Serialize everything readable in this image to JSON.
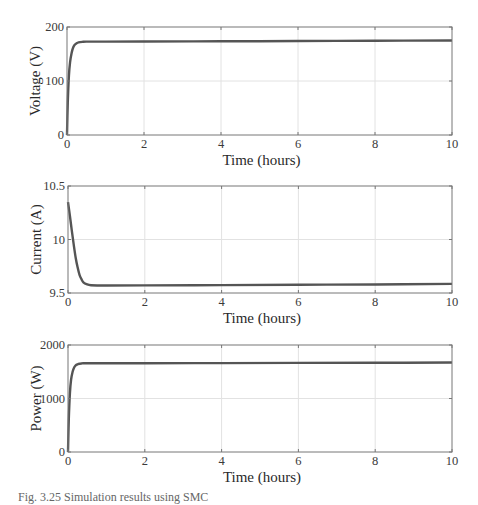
{
  "chart_data": [
    {
      "type": "line",
      "title": "",
      "xlabel": "Time (hours)",
      "ylabel": "Voltage (V)",
      "xlim": [
        0,
        10
      ],
      "ylim": [
        0,
        200
      ],
      "xticks": [
        "0",
        "2",
        "4",
        "6",
        "8",
        "10"
      ],
      "yticks": [
        "0",
        "100",
        "200"
      ],
      "grid": true,
      "series": [
        {
          "name": "Voltage",
          "color": "#555555",
          "x": [
            0,
            0.02,
            0.05,
            0.08,
            0.12,
            0.16,
            0.2,
            0.25,
            0.3,
            0.4,
            0.5,
            1,
            2,
            4,
            6,
            8,
            10
          ],
          "y": [
            0,
            60,
            110,
            135,
            152,
            162,
            167,
            170,
            171.5,
            172.5,
            173,
            173,
            173.2,
            173.5,
            174,
            174.5,
            175
          ]
        }
      ]
    },
    {
      "type": "line",
      "title": "",
      "xlabel": "Time (hours)",
      "ylabel": "Current (A)",
      "xlim": [
        0,
        10
      ],
      "ylim": [
        9.5,
        10.5
      ],
      "xticks": [
        "0",
        "2",
        "4",
        "6",
        "8",
        "10"
      ],
      "yticks": [
        "9.5",
        "10",
        "10.5"
      ],
      "grid": true,
      "series": [
        {
          "name": "Current",
          "color": "#555555",
          "x": [
            0,
            0.05,
            0.1,
            0.15,
            0.2,
            0.25,
            0.3,
            0.35,
            0.4,
            0.5,
            0.6,
            0.8,
            1,
            2,
            4,
            6,
            8,
            10
          ],
          "y": [
            10.35,
            10.22,
            10.08,
            9.95,
            9.83,
            9.74,
            9.67,
            9.63,
            9.6,
            9.58,
            9.572,
            9.57,
            9.57,
            9.571,
            9.574,
            9.577,
            9.58,
            9.585
          ]
        }
      ]
    },
    {
      "type": "line",
      "title": "",
      "xlabel": "Time (hours)",
      "ylabel": "Power (W)",
      "xlim": [
        0,
        10
      ],
      "ylim": [
        0,
        2000
      ],
      "xticks": [
        "0",
        "2",
        "4",
        "6",
        "8",
        "10"
      ],
      "yticks": [
        "0",
        "1000",
        "2000"
      ],
      "grid": true,
      "series": [
        {
          "name": "Power",
          "color": "#555555",
          "x": [
            0,
            0.02,
            0.05,
            0.08,
            0.12,
            0.16,
            0.2,
            0.25,
            0.3,
            0.35,
            0.4,
            1,
            2,
            4,
            6,
            8,
            10
          ],
          "y": [
            0,
            600,
            1100,
            1350,
            1500,
            1580,
            1620,
            1640,
            1650,
            1655,
            1658,
            1660,
            1660,
            1662,
            1665,
            1668,
            1672
          ]
        }
      ]
    }
  ],
  "caption": "Fig. 3.25 Simulation results using SMC"
}
